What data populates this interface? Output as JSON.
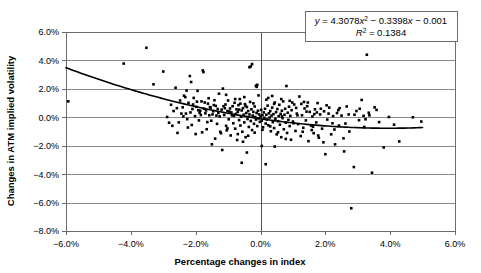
{
  "chart_data": {
    "type": "scatter",
    "title": "",
    "xlabel": "Percentage changes in index",
    "ylabel": "Changes in ATM implied volatility",
    "xlim": [
      -0.06,
      0.06
    ],
    "ylim": [
      -0.08,
      0.06
    ],
    "xticks": [
      "-6.0%",
      "-4.0%",
      "-2.0%",
      "0.0%",
      "2.0%",
      "4.0%",
      "6.0%"
    ],
    "xtick_values": [
      -0.06,
      -0.04,
      -0.02,
      0.0,
      0.02,
      0.04,
      0.06
    ],
    "yticks": [
      "6.0%",
      "4.0%",
      "2.0%",
      "0.0%",
      "-2.0%",
      "-4.0%",
      "-6.0%",
      "-8.0%"
    ],
    "ytick_values": [
      0.06,
      0.04,
      0.02,
      0.0,
      -0.02,
      -0.04,
      -0.06,
      -0.08
    ],
    "grid": "horizontal",
    "legend": "none",
    "marker_color": "#000000",
    "marker_shape": "square",
    "trendline": {
      "type": "polynomial",
      "degree": 2,
      "coefficients": [
        4.3078,
        -0.3398,
        -0.001
      ],
      "equation": "y = 4.3078x² − 0.3398x − 0.001",
      "r_squared_label": "R² = 0.1384",
      "r_squared": 0.1384,
      "color": "#000000",
      "x_range": [
        -0.06,
        0.05
      ]
    },
    "annotation": {
      "equation_prefix": "y",
      "equation_body": " = 4.3078",
      "equation_x1": "x",
      "equation_sup1": "2",
      "equation_mid": " − 0.3398",
      "equation_x2": "x",
      "equation_tail": " − 0.001",
      "r_prefix": "R",
      "r_sup": "2",
      "r_tail": " = 0.1384"
    },
    "points": [
      [
        -0.0593,
        0.0112
      ],
      [
        -0.0422,
        0.0378
      ],
      [
        -0.0352,
        0.0489
      ],
      [
        -0.033,
        0.0232
      ],
      [
        -0.03,
        0.0322
      ],
      [
        -0.0288,
        0.0002
      ],
      [
        -0.0282,
        -0.0038
      ],
      [
        -0.0276,
        0.0088
      ],
      [
        -0.0272,
        -0.006
      ],
      [
        -0.0262,
        0.0208
      ],
      [
        -0.0258,
        0.0064
      ],
      [
        -0.0248,
        0.0118
      ],
      [
        -0.024,
        0.007
      ],
      [
        -0.0236,
        0.0152
      ],
      [
        -0.023,
        0.0026
      ],
      [
        -0.0226,
        -0.0013
      ],
      [
        -0.0222,
        0.0102
      ],
      [
        -0.0218,
        0.029
      ],
      [
        -0.0214,
        0.0248
      ],
      [
        -0.021,
        0.0058
      ],
      [
        -0.0206,
        0.0136
      ],
      [
        -0.0202,
        0.0008
      ],
      [
        -0.0198,
        0.0074
      ],
      [
        -0.0194,
        0.0186
      ],
      [
        -0.019,
        -0.0022
      ],
      [
        -0.0186,
        0.0046
      ],
      [
        -0.0182,
        0.0112
      ],
      [
        -0.0178,
        0.033
      ],
      [
        -0.0176,
        0.0318
      ],
      [
        -0.0174,
        0.006
      ],
      [
        -0.017,
        0.0028
      ],
      [
        -0.0166,
        -0.0084
      ],
      [
        -0.0162,
        0.0096
      ],
      [
        -0.0158,
        0.0014
      ],
      [
        -0.0154,
        0.0068
      ],
      [
        -0.015,
        -0.019
      ],
      [
        -0.0146,
        0.0042
      ],
      [
        -0.0142,
        0.012
      ],
      [
        -0.0138,
        0.008
      ],
      [
        -0.0134,
        -0.0046
      ],
      [
        -0.013,
        0.003
      ],
      [
        -0.0128,
        0.0166
      ],
      [
        -0.0124,
        -0.0102
      ],
      [
        -0.012,
        0.0054
      ],
      [
        -0.0118,
        -0.023
      ],
      [
        -0.0116,
        0.0202
      ],
      [
        -0.0112,
        0.0016
      ],
      [
        -0.0108,
        0.009
      ],
      [
        -0.0106,
        -0.006
      ],
      [
        -0.0102,
        0.0044
      ],
      [
        -0.01,
        0.0118
      ],
      [
        -0.0098,
        -0.0014
      ],
      [
        -0.0094,
        0.0062
      ],
      [
        -0.0092,
        -0.0128
      ],
      [
        -0.009,
        0.0034
      ],
      [
        -0.0086,
        0.0078
      ],
      [
        -0.0084,
        -0.0042
      ],
      [
        -0.0082,
        0.001
      ],
      [
        -0.008,
        0.0102
      ],
      [
        -0.0078,
        -0.008
      ],
      [
        -0.0076,
        0.0024
      ],
      [
        -0.0074,
        0.0056
      ],
      [
        -0.0072,
        -0.016
      ],
      [
        -0.007,
        0.0038
      ],
      [
        -0.0068,
        0.0086
      ],
      [
        -0.0066,
        -0.002
      ],
      [
        -0.0064,
        0.0128
      ],
      [
        -0.0062,
        -0.0058
      ],
      [
        -0.006,
        0.0004
      ],
      [
        -0.0058,
        0.0048
      ],
      [
        -0.0056,
        -0.0102
      ],
      [
        -0.0054,
        0.0064
      ],
      [
        -0.0052,
        0.0018
      ],
      [
        -0.005,
        -0.0036
      ],
      [
        -0.0048,
        0.0092
      ],
      [
        -0.0046,
        -0.014
      ],
      [
        -0.0044,
        0.003
      ],
      [
        -0.0042,
        0.0072
      ],
      [
        -0.004,
        -0.0012
      ],
      [
        -0.0038,
        0.0044
      ],
      [
        -0.0036,
        -0.0068
      ],
      [
        -0.0034,
        0.002
      ],
      [
        -0.0032,
        0.0108
      ],
      [
        -0.003,
        -0.0026
      ],
      [
        -0.0028,
        0.0056
      ],
      [
        -0.0026,
        -0.009
      ],
      [
        -0.0024,
        0.0012
      ],
      [
        -0.0022,
        0.0038
      ],
      [
        -0.002,
        -0.0046
      ],
      [
        -0.0018,
        0.0076
      ],
      [
        -0.0016,
        0.0002
      ],
      [
        -0.0014,
        -0.0016
      ],
      [
        -0.0012,
        0.003
      ],
      [
        -0.001,
        -0.0062
      ],
      [
        -0.0008,
        0.0046
      ],
      [
        -0.0006,
        -0.0008
      ],
      [
        -0.0004,
        0.002
      ],
      [
        -0.0002,
        -0.0032
      ],
      [
        0.0,
        0.0006
      ],
      [
        0.0002,
        0.0052
      ],
      [
        0.0004,
        -0.0024
      ],
      [
        0.0006,
        0.0014
      ],
      [
        0.0008,
        -0.007
      ],
      [
        0.001,
        0.0034
      ],
      [
        0.0012,
        -0.0004
      ],
      [
        0.0014,
        0.006
      ],
      [
        0.0016,
        -0.0044
      ],
      [
        0.0018,
        0.0018
      ],
      [
        0.002,
        -0.0016
      ],
      [
        0.0022,
        0.0082
      ],
      [
        0.0024,
        -0.0056
      ],
      [
        0.0026,
        0.0028
      ],
      [
        0.0028,
        -0.0002
      ],
      [
        0.003,
        0.0044
      ],
      [
        0.0032,
        -0.0098
      ],
      [
        0.0034,
        0.0012
      ],
      [
        0.0036,
        0.0068
      ],
      [
        0.0038,
        -0.0034
      ],
      [
        0.004,
        0.0022
      ],
      [
        0.0042,
        -0.0076
      ],
      [
        0.0044,
        0.0104
      ],
      [
        0.0046,
        -0.001
      ],
      [
        0.0048,
        0.0036
      ],
      [
        0.005,
        -0.012
      ],
      [
        0.0052,
        0.0058
      ],
      [
        0.0054,
        -0.0028
      ],
      [
        0.0056,
        0.0008
      ],
      [
        0.0058,
        0.0088
      ],
      [
        0.006,
        -0.0052
      ],
      [
        0.0062,
        0.0024
      ],
      [
        0.0064,
        -0.014
      ],
      [
        0.0066,
        0.0046
      ],
      [
        0.0068,
        -0.0006
      ],
      [
        0.007,
        0.0112
      ],
      [
        0.0072,
        -0.0084
      ],
      [
        0.0074,
        0.0018
      ],
      [
        0.0076,
        0.006
      ],
      [
        0.0078,
        -0.0038
      ],
      [
        0.008,
        0.022
      ],
      [
        0.0082,
        -0.011
      ],
      [
        0.0084,
        0.0032
      ],
      [
        0.0086,
        -0.0018
      ],
      [
        0.0088,
        0.0074
      ],
      [
        0.009,
        -0.0062
      ],
      [
        0.0092,
        0.001
      ],
      [
        0.0094,
        -0.0158
      ],
      [
        0.0096,
        0.005
      ],
      [
        0.01,
        -0.003
      ],
      [
        0.0104,
        0.009
      ],
      [
        0.0108,
        -0.0096
      ],
      [
        0.0112,
        0.0026
      ],
      [
        0.0116,
        -0.0048
      ],
      [
        0.012,
        0.0146
      ],
      [
        0.0124,
        -0.0132
      ],
      [
        0.0128,
        0.0014
      ],
      [
        0.0132,
        -0.0074
      ],
      [
        0.0136,
        0.0062
      ],
      [
        0.014,
        -0.0022
      ],
      [
        0.0144,
        0.0078
      ],
      [
        0.0148,
        -0.0168
      ],
      [
        0.0152,
        0.0038
      ],
      [
        0.0156,
        -0.0058
      ],
      [
        0.016,
        0.0006
      ],
      [
        0.0164,
        -0.0112
      ],
      [
        0.0168,
        0.0056
      ],
      [
        0.0172,
        -0.0036
      ],
      [
        0.0176,
        0.01
      ],
      [
        0.018,
        -0.0144
      ],
      [
        0.0184,
        0.002
      ],
      [
        0.019,
        -0.008
      ],
      [
        0.0196,
        0.0042
      ],
      [
        0.02,
        -0.026
      ],
      [
        0.0206,
        -0.0016
      ],
      [
        0.0212,
        0.0068
      ],
      [
        0.0218,
        -0.012
      ],
      [
        0.0224,
        0.0008
      ],
      [
        0.023,
        -0.019
      ],
      [
        0.0236,
        0.003
      ],
      [
        0.0242,
        -0.0058
      ],
      [
        0.025,
        0.0012
      ],
      [
        0.0258,
        -0.024
      ],
      [
        0.0266,
        0.0076
      ],
      [
        0.0274,
        -0.01
      ],
      [
        0.028,
        -0.064
      ],
      [
        0.0288,
        -0.035
      ],
      [
        0.0296,
        0.0044
      ],
      [
        0.0304,
        -0.002
      ],
      [
        0.0312,
        0.0122
      ],
      [
        0.032,
        -0.0068
      ],
      [
        0.0328,
        0.044
      ],
      [
        0.0336,
        0.0014
      ],
      [
        0.0344,
        -0.039
      ],
      [
        0.0352,
        0.007
      ],
      [
        0.0366,
        -0.0034
      ],
      [
        0.038,
        -0.0212
      ],
      [
        0.0396,
        0.0002
      ],
      [
        0.0412,
        -0.0052
      ],
      [
        0.0428,
        -0.017
      ],
      [
        0.047,
        0.0
      ],
      [
        0.0496,
        -0.003
      ],
      [
        -0.0252,
        -0.0036
      ],
      [
        -0.0244,
        0.0026
      ],
      [
        -0.0232,
        0.0142
      ],
      [
        -0.0224,
        -0.0072
      ],
      [
        -0.0216,
        0.0034
      ],
      [
        -0.0208,
        0.009
      ],
      [
        -0.02,
        -0.0118
      ],
      [
        -0.0192,
        0.005
      ],
      [
        -0.0184,
        0.0016
      ],
      [
        -0.0172,
        0.0104
      ],
      [
        -0.0164,
        -0.0034
      ],
      [
        -0.0156,
        0.0072
      ],
      [
        -0.0148,
        0.002
      ],
      [
        -0.014,
        -0.015
      ],
      [
        -0.0132,
        0.0058
      ],
      [
        -0.0126,
        0.0006
      ],
      [
        -0.0114,
        0.0078
      ],
      [
        -0.0104,
        -0.0092
      ],
      [
        -0.0096,
        0.004
      ],
      [
        -0.0088,
        0.0014
      ],
      [
        -0.0062,
        0.0096
      ],
      [
        -0.0058,
        -0.032
      ],
      [
        -0.005,
        0.0142
      ],
      [
        -0.0042,
        -0.0248
      ],
      [
        -0.0034,
        0.0352
      ],
      [
        -0.003,
        0.0358
      ],
      [
        -0.0026,
        0.0374
      ],
      [
        -0.0014,
        0.0222
      ],
      [
        -0.0012,
        0.0214
      ],
      [
        -0.001,
        0.0228
      ],
      [
        0.0004,
        -0.0202
      ],
      [
        0.0016,
        -0.033
      ],
      [
        0.0024,
        0.0136
      ],
      [
        0.0036,
        0.015
      ],
      [
        0.0044,
        -0.0206
      ],
      [
        0.0064,
        0.0128
      ],
      [
        0.0098,
        0.0104
      ],
      [
        0.011,
        0.0066
      ],
      [
        0.0126,
        0.0094
      ],
      [
        0.0134,
        0.0108
      ],
      [
        0.0142,
        0.004
      ],
      [
        0.0158,
        -0.009
      ],
      [
        0.0166,
        0.0022
      ],
      [
        0.0178,
        -0.0128
      ],
      [
        0.0186,
        0.006
      ],
      [
        0.0204,
        0.0084
      ],
      [
        0.0222,
        -0.0042
      ],
      [
        0.024,
        0.005
      ],
      [
        0.0256,
        -0.0148
      ],
      [
        0.0272,
        0.002
      ],
      [
        0.0306,
        0.006
      ],
      [
        0.0318,
        0.001
      ],
      [
        0.0334,
        0.0032
      ],
      [
        -0.0268,
        0.0044
      ],
      [
        -0.0256,
        -0.011
      ],
      [
        -0.0238,
        0.0006
      ],
      [
        -0.0228,
        0.0188
      ],
      [
        -0.0212,
        -0.0054
      ],
      [
        -0.0196,
        0.011
      ],
      [
        -0.0188,
        0.0032
      ],
      [
        -0.018,
        -0.0106
      ],
      [
        -0.0168,
        0.0048
      ],
      [
        -0.016,
        0.0134
      ],
      [
        -0.0152,
        -0.0024
      ],
      [
        -0.0144,
        0.0086
      ],
      [
        -0.0136,
        0.0012
      ],
      [
        -0.0122,
        -0.0112
      ],
      [
        -0.011,
        0.0064
      ],
      [
        -0.0106,
        0.0158
      ],
      [
        -0.0102,
        -0.0078
      ],
      [
        -0.0078,
        0.0128
      ],
      [
        -0.007,
        -0.0118
      ],
      [
        -0.0066,
        0.0054
      ],
      [
        -0.0054,
        -0.0172
      ],
      [
        -0.0046,
        0.008
      ],
      [
        -0.0038,
        -0.013
      ],
      [
        -0.0022,
        0.0098
      ],
      [
        -0.0018,
        -0.0108
      ],
      [
        -0.0006,
        0.0154
      ],
      [
        0.0006,
        -0.0088
      ],
      [
        0.0018,
        0.0124
      ],
      [
        0.003,
        -0.0064
      ],
      [
        0.0042,
        0.0094
      ],
      [
        0.0054,
        -0.0106
      ],
      [
        0.0066,
        0.0006
      ],
      [
        0.0078,
        -0.0152
      ],
      [
        0.009,
        0.0116
      ],
      [
        0.0102,
        -0.0042
      ],
      [
        0.0114,
        0.0014
      ],
      [
        0.013,
        -0.0102
      ],
      [
        0.0146,
        0.0104
      ],
      [
        0.0162,
        -0.0066
      ],
      [
        0.0174,
        0.0034
      ],
      [
        0.0194,
        -0.0176
      ],
      [
        0.021,
        0.0026
      ],
      [
        0.0228,
        -0.0086
      ],
      [
        0.0244,
        0.0064
      ],
      [
        0.0262,
        -0.0044
      ],
      [
        0.029,
        0.0018
      ],
      [
        0.0324,
        -0.0014
      ],
      [
        0.0358,
        0.0052
      ]
    ]
  }
}
